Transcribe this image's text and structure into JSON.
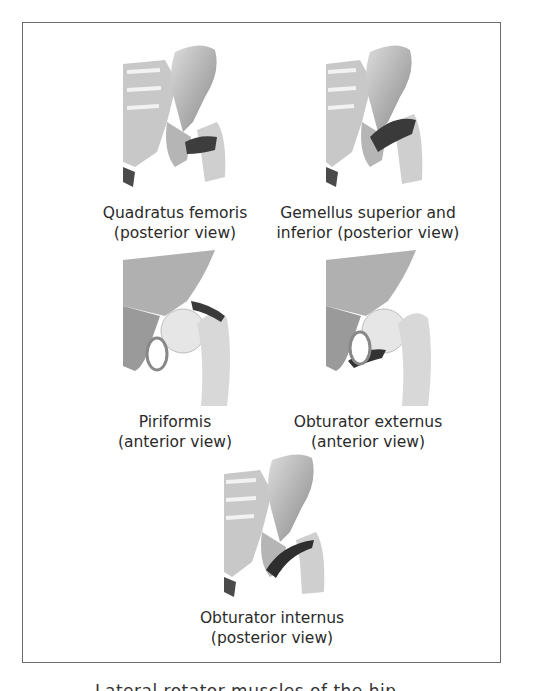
{
  "figures": [
    {
      "id": "quadratus-femoris",
      "line1": "Quadratus femoris",
      "line2": "(posterior view)",
      "view": "posterior"
    },
    {
      "id": "gemellus",
      "line1": "Gemellus superior and",
      "line2": "inferior (posterior view)",
      "view": "posterior"
    },
    {
      "id": "piriformis",
      "line1": "Piriformis",
      "line2": "(anterior view)",
      "view": "anterior"
    },
    {
      "id": "obturator-externus",
      "line1": "Obturator externus",
      "line2": "(anterior view)",
      "view": "anterior"
    },
    {
      "id": "obturator-internus",
      "line1": "Obturator internus",
      "line2": "(posterior view)",
      "view": "posterior"
    }
  ],
  "bottom_caption": "Lateral rotator muscles of the hip",
  "colors": {
    "border": "#6b6b6b",
    "bone_light": "#e8e8e8",
    "bone_mid": "#a9a9a9",
    "bone_dark": "#6e6e6e",
    "muscle": "#3a3a3a"
  }
}
